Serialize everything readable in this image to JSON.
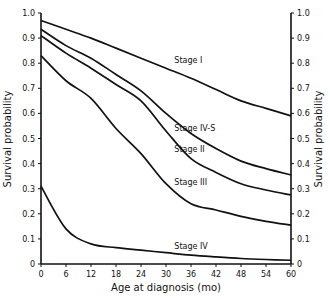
{
  "chart_data": {
    "type": "line",
    "title": "",
    "xlabel": "Age at diagnosis (mo)",
    "ylabel": "Survival probability",
    "ylabel_right": "Survival probability",
    "xlim": [
      0,
      60
    ],
    "ylim": [
      0,
      1.0
    ],
    "x_ticks": [
      0,
      6,
      12,
      18,
      24,
      30,
      36,
      42,
      48,
      54,
      60
    ],
    "y_ticks": [
      0,
      0.1,
      0.2,
      0.3,
      0.4,
      0.5,
      0.6,
      0.7,
      0.8,
      0.9,
      1.0
    ],
    "y_tick_labels": [
      "0",
      "0.1",
      "0.2",
      "0.3",
      "0.4",
      "0.5",
      "0.6",
      "0.7",
      "0.8",
      "0.9",
      "1.0"
    ],
    "x_tick_labels": [
      "0",
      "6",
      "12",
      "18",
      "24",
      "30",
      "36",
      "42",
      "48",
      "54",
      "60"
    ],
    "grid": false,
    "legend": "inline labels",
    "x": [
      0,
      6,
      12,
      18,
      24,
      30,
      36,
      42,
      48,
      54,
      60
    ],
    "series": [
      {
        "name": "Stage I",
        "label_pos": [
          32,
          0.8
        ],
        "values": [
          0.97,
          0.935,
          0.9,
          0.86,
          0.82,
          0.78,
          0.74,
          0.695,
          0.65,
          0.62,
          0.59
        ]
      },
      {
        "name": "Stage IV-S",
        "label_pos": [
          32,
          0.53
        ],
        "values": [
          0.935,
          0.87,
          0.82,
          0.755,
          0.69,
          0.6,
          0.52,
          0.46,
          0.41,
          0.38,
          0.355
        ]
      },
      {
        "name": "Stage II",
        "label_pos": [
          32,
          0.445
        ],
        "values": [
          0.91,
          0.84,
          0.78,
          0.715,
          0.65,
          0.53,
          0.42,
          0.365,
          0.32,
          0.295,
          0.275
        ]
      },
      {
        "name": "Stage III",
        "label_pos": [
          32,
          0.315
        ],
        "values": [
          0.83,
          0.73,
          0.66,
          0.54,
          0.44,
          0.32,
          0.24,
          0.215,
          0.19,
          0.17,
          0.155
        ]
      },
      {
        "name": "Stage IV",
        "label_pos": [
          32,
          0.06
        ],
        "values": [
          0.31,
          0.14,
          0.08,
          0.065,
          0.055,
          0.045,
          0.035,
          0.028,
          0.022,
          0.018,
          0.015
        ]
      }
    ]
  }
}
